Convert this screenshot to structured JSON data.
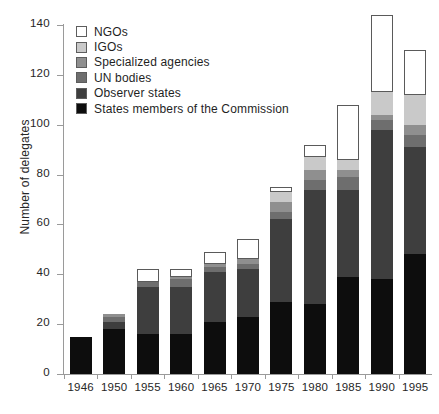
{
  "chart_data": {
    "type": "bar",
    "subtype": "stacked-bar",
    "title": "",
    "xlabel": "",
    "ylabel": "Number of delegates",
    "ylim": [
      0,
      140
    ],
    "yticks": [
      0,
      20,
      40,
      60,
      80,
      100,
      120,
      140
    ],
    "grid": false,
    "legend_position": "top-left",
    "categories": [
      "1946",
      "1950",
      "1955",
      "1960",
      "1965",
      "1970",
      "1975",
      "1980",
      "1985",
      "1990",
      "1995"
    ],
    "series": [
      {
        "name": "States members of the Commission",
        "color": "#0d0d0d",
        "values": [
          15,
          18,
          16,
          16,
          21,
          23,
          29,
          28,
          39,
          38,
          48
        ]
      },
      {
        "name": "Observer states",
        "color": "#3e3e3e",
        "values": [
          0,
          3,
          19,
          19,
          20,
          19,
          33,
          46,
          35,
          60,
          43
        ]
      },
      {
        "name": "UN bodies",
        "color": "#6e6e6e",
        "values": [
          0,
          2,
          2,
          3,
          2,
          2,
          3,
          4,
          5,
          4,
          5
        ]
      },
      {
        "name": "Specialized agencies",
        "color": "#8f8f8f",
        "values": [
          0,
          1,
          0,
          1,
          1,
          2,
          4,
          4,
          3,
          2,
          4
        ]
      },
      {
        "name": "IGOs",
        "color": "#c9c9c9",
        "values": [
          0,
          0,
          0,
          0,
          0,
          0,
          4,
          5,
          4,
          9,
          12
        ]
      },
      {
        "name": "NGOs",
        "color": "#ffffff",
        "values": [
          0,
          0,
          5,
          3,
          5,
          8,
          2,
          5,
          22,
          31,
          18
        ]
      }
    ],
    "totals": [
      15,
      24,
      42,
      42,
      49,
      54,
      75,
      92,
      108,
      144,
      130
    ]
  },
  "legend": {
    "items": [
      {
        "label": "NGOs",
        "color": "#ffffff"
      },
      {
        "label": "IGOs",
        "color": "#c9c9c9"
      },
      {
        "label": "Specialized agencies",
        "color": "#8f8f8f"
      },
      {
        "label": "UN bodies",
        "color": "#6e6e6e"
      },
      {
        "label": "Observer states",
        "color": "#3e3e3e"
      },
      {
        "label": "States members of the Commission",
        "color": "#0d0d0d"
      }
    ]
  },
  "axes": {
    "y_title": "Number of delegates",
    "y_tick_labels": [
      "0",
      "20",
      "40",
      "60",
      "80",
      "100",
      "120",
      "140"
    ],
    "x_tick_labels": [
      "1946",
      "1950",
      "1955",
      "1960",
      "1965",
      "1970",
      "1975",
      "1980",
      "1985",
      "1990",
      "1995"
    ]
  }
}
